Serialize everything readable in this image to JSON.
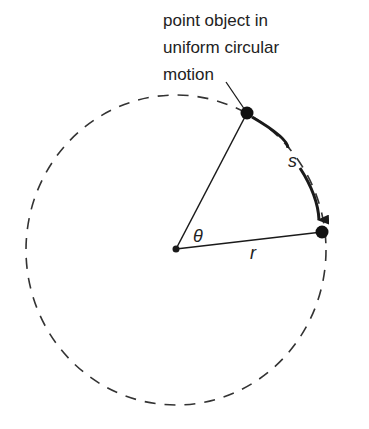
{
  "diagram": {
    "title_lines": [
      "point object in",
      "uniform circular",
      "motion"
    ],
    "labels": {
      "arc_length": "s",
      "angle": "θ",
      "radius": "r"
    },
    "colors": {
      "stroke": "#1a1a1a",
      "dashed_circle": "#333333",
      "background": "#ffffff"
    }
  }
}
